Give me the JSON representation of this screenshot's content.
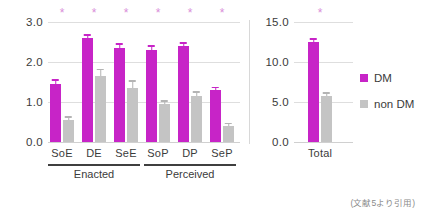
{
  "chart_data": {
    "type": "bar",
    "title": "",
    "xlabel": "",
    "ylabel": "",
    "grid": true,
    "legend_position": "right",
    "panels": [
      {
        "name": "left-panel",
        "ylim": [
          0,
          3.0
        ],
        "yticks": [
          "3.0",
          "2.0",
          "1.0",
          "0.0"
        ],
        "ytick_values": [
          3.0,
          2.0,
          1.0,
          0.0
        ],
        "categories": [
          "SoE",
          "DE",
          "SeE",
          "SoP",
          "DP",
          "SeP"
        ],
        "series": [
          {
            "name": "DM",
            "values": [
              1.45,
              2.6,
              2.35,
              2.3,
              2.4,
              1.3
            ],
            "errors": [
              0.12,
              0.1,
              0.12,
              0.12,
              0.1,
              0.08
            ],
            "color": "#c724c7"
          },
          {
            "name": "non DM",
            "values": [
              0.55,
              1.65,
              1.35,
              0.95,
              1.15,
              0.4
            ],
            "errors": [
              0.1,
              0.18,
              0.2,
              0.1,
              0.12,
              0.08
            ],
            "color": "#c4c4c4"
          }
        ],
        "significance": [
          "*",
          "*",
          "*",
          "*",
          "*",
          "*"
        ],
        "group_brackets": [
          {
            "label": "Enacted",
            "categories": [
              "SoE",
              "DE",
              "SeE"
            ]
          },
          {
            "label": "Perceived",
            "categories": [
              "SoP",
              "DP",
              "SeP"
            ]
          }
        ]
      },
      {
        "name": "right-panel",
        "ylim": [
          0,
          15.0
        ],
        "yticks": [
          "15.0",
          "10.0",
          "5.0",
          "0.0"
        ],
        "ytick_values": [
          15.0,
          10.0,
          5.0,
          0.0
        ],
        "categories": [
          "Total"
        ],
        "series": [
          {
            "name": "DM",
            "values": [
              12.5
            ],
            "errors": [
              0.45
            ],
            "color": "#c724c7"
          },
          {
            "name": "non DM",
            "values": [
              5.8
            ],
            "errors": [
              0.45
            ],
            "color": "#c4c4c4"
          }
        ],
        "significance": [
          "*"
        ],
        "group_brackets": []
      }
    ],
    "legend": [
      {
        "label": "DM",
        "color": "#c724c7"
      },
      {
        "label": "non DM",
        "color": "#c4c4c4"
      }
    ],
    "caption": "(文献5より引用)",
    "colors": {
      "dm": "#c724c7",
      "non_dm": "#c4c4c4",
      "grid": "#dedede",
      "text": "#3b3b3b",
      "star": "#d98fd9",
      "caption": "#8a8a8a"
    }
  }
}
